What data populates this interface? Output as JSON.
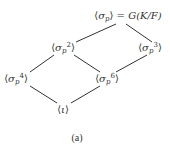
{
  "diagram": {
    "type": "subgroup-lattice",
    "caption": "(a)",
    "nodes": {
      "top": {
        "open": "⟨",
        "base": "σ",
        "sub": "p",
        "sup": "",
        "close": "⟩",
        "suffix": " = G(K/F)",
        "x": 128,
        "y": 17
      },
      "sp2": {
        "open": "⟨",
        "base": "σ",
        "sub": "p",
        "sup": "2",
        "close": "⟩",
        "suffix": "",
        "x": 63,
        "y": 48
      },
      "sp3": {
        "open": "⟨",
        "base": "σ",
        "sub": "p",
        "sup": "3",
        "close": "⟩",
        "suffix": "",
        "x": 150,
        "y": 48
      },
      "sp4": {
        "open": "⟨",
        "base": "σ",
        "sub": "p",
        "sup": "4",
        "close": "⟩",
        "suffix": "",
        "x": 15,
        "y": 79
      },
      "sp6": {
        "open": "⟨",
        "base": "σ",
        "sub": "p",
        "sup": "6",
        "close": "⟩",
        "suffix": "",
        "x": 107,
        "y": 79
      },
      "iota": {
        "open": "⟨",
        "base": "ι",
        "sub": "",
        "sup": "",
        "close": "⟩",
        "suffix": "",
        "x": 63,
        "y": 110
      }
    },
    "edges": [
      {
        "from": "top",
        "to": "sp2",
        "x1": 116,
        "y1": 24,
        "x2": 76,
        "y2": 42
      },
      {
        "from": "top",
        "to": "sp3",
        "x1": 126,
        "y1": 24,
        "x2": 152,
        "y2": 42
      },
      {
        "from": "sp2",
        "to": "sp4",
        "x1": 54,
        "y1": 55,
        "x2": 30,
        "y2": 72
      },
      {
        "from": "sp2",
        "to": "sp6",
        "x1": 74,
        "y1": 55,
        "x2": 100,
        "y2": 72
      },
      {
        "from": "sp3",
        "to": "sp6",
        "x1": 147,
        "y1": 55,
        "x2": 116,
        "y2": 72
      },
      {
        "from": "sp4",
        "to": "iota",
        "x1": 30,
        "y1": 86,
        "x2": 57,
        "y2": 103
      },
      {
        "from": "sp6",
        "to": "iota",
        "x1": 100,
        "y1": 86,
        "x2": 71,
        "y2": 103
      }
    ],
    "colors": {
      "ink": "#333333",
      "background": "#ffffff"
    }
  }
}
